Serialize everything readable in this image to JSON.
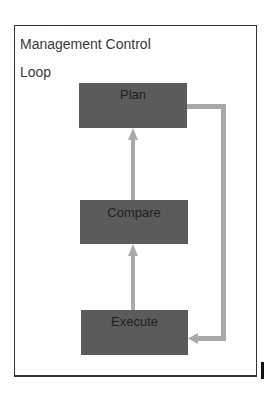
{
  "title": {
    "line1": "Management Control",
    "line2": "Loop"
  },
  "nodes": [
    {
      "id": "plan",
      "label": "Plan"
    },
    {
      "id": "compare",
      "label": "Compare"
    },
    {
      "id": "execute",
      "label": "Execute"
    }
  ],
  "edges": [
    {
      "from": "execute",
      "to": "compare"
    },
    {
      "from": "compare",
      "to": "plan"
    },
    {
      "from": "plan",
      "to": "execute",
      "route": "right-side feedback loop"
    }
  ],
  "colors": {
    "box_fill": "#5b5b5b",
    "connector": "#a9a9a9",
    "border": "#333333",
    "text": "#1e1e1e"
  }
}
